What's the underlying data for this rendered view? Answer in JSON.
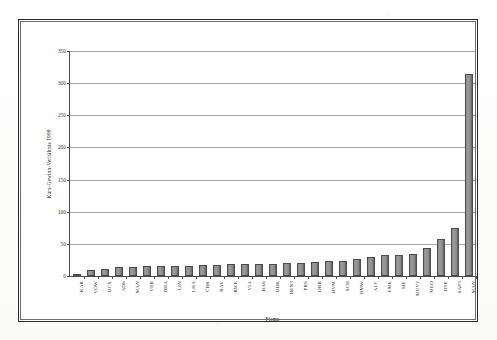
{
  "chart_data": {
    "type": "bar",
    "title": "",
    "xlabel": "Firma",
    "ylabel": "Kurs-Gewinn-Verhältnis 1999",
    "ylim": [
      0,
      350
    ],
    "yticks": [
      0,
      50,
      100,
      150,
      200,
      250,
      300,
      350
    ],
    "grid": true,
    "legend": "none",
    "orientation": "vertical",
    "categories": [
      "KAR",
      "VOW",
      "DCX",
      "ADS",
      "MAN",
      "VEB",
      "DHA",
      "LIN",
      "LHA",
      "CBK",
      "BAY",
      "RWE",
      "VIA",
      "BAS",
      "DBK",
      "HEN3",
      "PRS",
      "DRB",
      "HVM",
      "SCH",
      "BMW",
      "ALV",
      "FME",
      "SIE",
      "MUV2",
      "MEO",
      "DTE",
      "SAP3",
      "MAN"
    ],
    "values": [
      3,
      10,
      11,
      14,
      14,
      15,
      15,
      16,
      16,
      17,
      17,
      18,
      18,
      18,
      19,
      20,
      21,
      22,
      23,
      24,
      26,
      30,
      32,
      33,
      35,
      44,
      58,
      75,
      315
    ],
    "bar_color": "#8d8d8d",
    "bar_edge_color": "#4c4c4c",
    "gridline_color": "#a6a6a6",
    "axis_color": "#4a4a4a",
    "frame_color": "#2a2a2a"
  },
  "axes": {
    "y_title": "Kurs-Gewinn-Verhältnis 1999",
    "x_title": "Firma"
  }
}
